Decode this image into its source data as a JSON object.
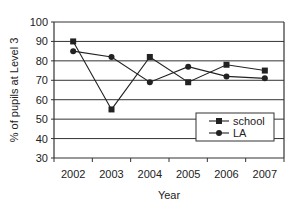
{
  "chart_data": {
    "type": "line",
    "title": "",
    "xlabel": "Year",
    "ylabel": "% of pupils at Level 3",
    "categories": [
      "2002",
      "2003",
      "2004",
      "2005",
      "2006",
      "2007"
    ],
    "series": [
      {
        "name": "school",
        "marker": "square",
        "values": [
          90,
          55,
          82,
          69,
          78,
          75
        ]
      },
      {
        "name": "LA",
        "marker": "circle",
        "values": [
          85,
          82,
          69,
          77,
          72,
          71
        ]
      }
    ],
    "ylim": [
      30,
      100
    ],
    "yticks": [
      30,
      40,
      50,
      60,
      70,
      80,
      90,
      100
    ],
    "grid": true,
    "legend_position": "lower right inside"
  },
  "colors": {
    "line": "#222222",
    "grid": "#333333",
    "background": "#ffffff"
  }
}
